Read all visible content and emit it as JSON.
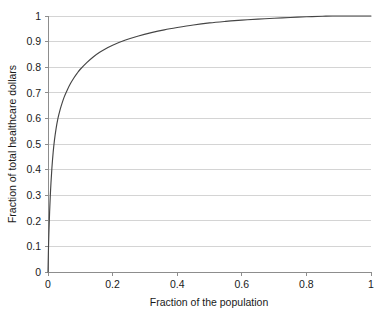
{
  "chart_data": {
    "type": "line",
    "title": "",
    "xlabel": "Fraction of the population",
    "ylabel": "Fraction of total healthcare dollars",
    "xlim": [
      0,
      1
    ],
    "ylim": [
      0,
      1
    ],
    "grid": "horizontal",
    "legend": "none",
    "xticks": [
      "0",
      "0.2",
      "0.4",
      "0.6",
      "0.8",
      "1"
    ],
    "xtick_values": [
      0,
      0.2,
      0.4,
      0.6,
      0.8,
      1
    ],
    "yticks": [
      "0",
      "0.1",
      "0.2",
      "0.3",
      "0.4",
      "0.5",
      "0.6",
      "0.7",
      "0.8",
      "0.9",
      "1"
    ],
    "ytick_values": [
      0,
      0.1,
      0.2,
      0.3,
      0.4,
      0.5,
      0.6,
      0.7,
      0.8,
      0.9,
      1
    ],
    "series": [
      {
        "name": "Concentration of healthcare spending",
        "color": "#454545",
        "x": [
          0.0,
          0.002,
          0.005,
          0.008,
          0.012,
          0.016,
          0.02,
          0.025,
          0.03,
          0.035,
          0.04,
          0.05,
          0.06,
          0.07,
          0.08,
          0.09,
          0.1,
          0.12,
          0.14,
          0.16,
          0.18,
          0.2,
          0.24,
          0.28,
          0.32,
          0.36,
          0.4,
          0.45,
          0.5,
          0.55,
          0.6,
          0.65,
          0.7,
          0.75,
          0.8,
          0.85,
          0.88,
          0.92,
          0.96,
          1.0
        ],
        "y": [
          0.0,
          0.12,
          0.235,
          0.32,
          0.405,
          0.468,
          0.515,
          0.56,
          0.595,
          0.622,
          0.645,
          0.683,
          0.712,
          0.737,
          0.758,
          0.776,
          0.792,
          0.818,
          0.84,
          0.858,
          0.873,
          0.886,
          0.906,
          0.922,
          0.935,
          0.946,
          0.955,
          0.965,
          0.973,
          0.979,
          0.984,
          0.988,
          0.991,
          0.994,
          0.997,
          0.999,
          1.0,
          1.0,
          1.0,
          1.0
        ]
      }
    ]
  },
  "plot": {
    "geometry": {
      "left": 48,
      "right": 371,
      "top": 16,
      "bottom": 272
    },
    "colors": {
      "curve": "#454545",
      "grid": "#c9c9c9",
      "axis": "#8d8d8d",
      "text": "#1a1a1a",
      "background": "#ffffff"
    }
  }
}
